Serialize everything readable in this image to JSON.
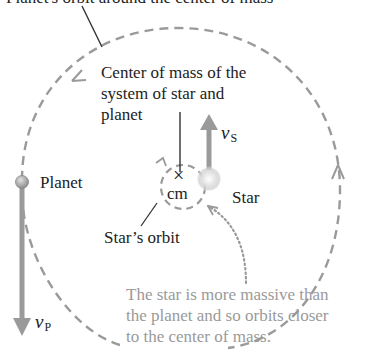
{
  "diagram": {
    "top_label_clipped": "Planet's orbit around the center of mass",
    "center_of_mass_label": [
      "Center of mass of the",
      "system of star and",
      "planet"
    ],
    "cm_symbol": "×",
    "cm_label": "cm",
    "star_label": "Star",
    "planet_label": "Planet",
    "star_orbit_label": "Star’s orbit",
    "star_velocity": {
      "symbol": "v",
      "subscript": "S"
    },
    "planet_velocity": {
      "symbol": "v",
      "subscript": "P"
    },
    "note": [
      "The star is more massive than",
      "the planet and so orbits closer",
      "to the center of mass."
    ],
    "colors": {
      "orbit_dash": "#9a9a9a",
      "arrow": "#9a9a9a",
      "text": "#222222",
      "note_text": "#9a9a9a",
      "star_glow": "#d8d8d8",
      "planet": "#aaaaaa"
    }
  }
}
